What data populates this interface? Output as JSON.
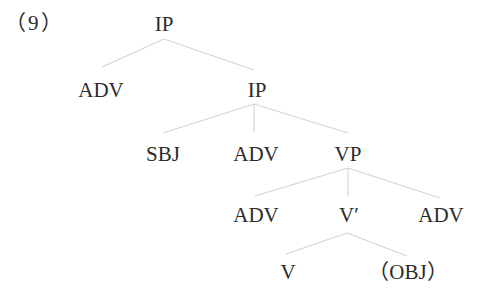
{
  "example_label": "（9）",
  "tree": {
    "nodes": [
      {
        "id": "ip_root",
        "label": "IP",
        "x": 164,
        "y": 13
      },
      {
        "id": "adv_1",
        "label": "ADV",
        "x": 101,
        "y": 79
      },
      {
        "id": "ip_2",
        "label": "IP",
        "x": 257,
        "y": 79
      },
      {
        "id": "sbj",
        "label": "SBJ",
        "x": 163,
        "y": 143
      },
      {
        "id": "adv_2",
        "label": "ADV",
        "x": 256,
        "y": 143
      },
      {
        "id": "vp",
        "label": "VP",
        "x": 348,
        "y": 143
      },
      {
        "id": "adv_3",
        "label": "ADV",
        "x": 256,
        "y": 204
      },
      {
        "id": "v_bar",
        "label": "V′",
        "x": 349,
        "y": 204
      },
      {
        "id": "adv_4",
        "label": "ADV",
        "x": 441,
        "y": 204
      },
      {
        "id": "v",
        "label": "V",
        "x": 288,
        "y": 261
      },
      {
        "id": "obj",
        "label": "（OBJ）",
        "x": 408,
        "y": 261
      }
    ],
    "edges": [
      {
        "from": "ip_root",
        "to": "adv_1"
      },
      {
        "from": "ip_root",
        "to": "ip_2"
      },
      {
        "from": "ip_2",
        "to": "sbj"
      },
      {
        "from": "ip_2",
        "to": "adv_2"
      },
      {
        "from": "ip_2",
        "to": "vp"
      },
      {
        "from": "vp",
        "to": "adv_3"
      },
      {
        "from": "vp",
        "to": "v_bar"
      },
      {
        "from": "vp",
        "to": "adv_4"
      },
      {
        "from": "v_bar",
        "to": "v"
      },
      {
        "from": "v_bar",
        "to": "obj"
      }
    ]
  }
}
